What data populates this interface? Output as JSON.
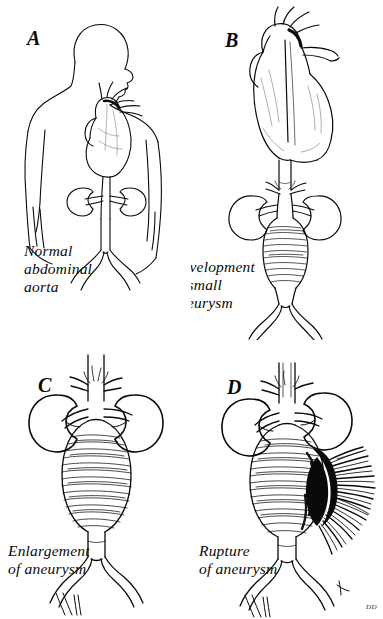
{
  "figure": {
    "style": "pen-and-ink medical line illustration",
    "background_color": "#ffffff",
    "ink_color": "#0a0a0a",
    "panel_count": 4,
    "signature": "DD"
  },
  "panels": [
    {
      "letter": "A",
      "caption": "Normal\nabdominal\naorta",
      "name": "panel-a",
      "description": "Torso outline with heart, thoracic and abdominal aorta, both kidneys, iliac bifurcation"
    },
    {
      "letter": "B",
      "caption": "Development\nof small\naneurysm",
      "name": "panel-b",
      "description": "Heart with great vessels, descending aorta, kidneys and small fusiform aneurysm"
    },
    {
      "letter": "C",
      "caption": "Enlargement\nof aneurysm",
      "name": "panel-c",
      "description": "Kidneys flanking a large ovoid abdominal aortic aneurysm above the iliac bifurcation"
    },
    {
      "letter": "D",
      "caption": "Rupture\nof aneurysm",
      "name": "panel-d",
      "description": "Large aneurysm rupturing on the right side with dark radiating hemorrhage"
    }
  ]
}
